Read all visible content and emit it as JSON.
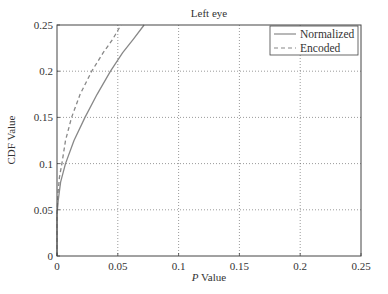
{
  "chart_data": {
    "type": "line",
    "title": "Left eye",
    "xlabel": "P Value",
    "xlabel_italic_prefix": "P",
    "xlabel_suffix": " Value",
    "ylabel": "CDF Value",
    "xlim": [
      0,
      0.25
    ],
    "ylim": [
      0,
      0.25
    ],
    "xticks": [
      0,
      0.05,
      0.1,
      0.15,
      0.2,
      0.25
    ],
    "xtick_labels": [
      "0",
      "0.05",
      "0.1",
      "0.15",
      "0.2",
      "0.25"
    ],
    "yticks": [
      0,
      0.05,
      0.1,
      0.15,
      0.2,
      0.25
    ],
    "ytick_labels": [
      "0",
      "0.05",
      "0.1",
      "0.15",
      "0.2",
      "0.25"
    ],
    "grid": true,
    "legend_position": "upper right",
    "series": [
      {
        "name": "Normalized",
        "style": "solid",
        "color": "#888888",
        "x": [
          0,
          0.001,
          0.003,
          0.007,
          0.014,
          0.023,
          0.033,
          0.044,
          0.054,
          0.063,
          0.0716
        ],
        "y": [
          0.045,
          0.06,
          0.08,
          0.1,
          0.125,
          0.15,
          0.175,
          0.2,
          0.22,
          0.235,
          0.25
        ]
      },
      {
        "name": "Encoded",
        "style": "dashed",
        "color": "#888888",
        "x": [
          0,
          0.001,
          0.002,
          0.004,
          0.007,
          0.012,
          0.019,
          0.0285,
          0.038,
          0.046,
          0.0526
        ],
        "y": [
          0.045,
          0.07,
          0.085,
          0.1,
          0.125,
          0.15,
          0.175,
          0.2,
          0.22,
          0.235,
          0.25
        ]
      }
    ]
  },
  "legend": {
    "items": [
      {
        "label": "Normalized",
        "style": "solid"
      },
      {
        "label": "Encoded",
        "style": "dashed"
      }
    ]
  },
  "colors": {
    "axis": "#444444",
    "grid": "#555555",
    "line": "#888888"
  }
}
